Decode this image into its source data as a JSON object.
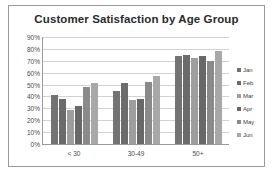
{
  "chart_data": {
    "type": "bar",
    "title": "Customer Satisfaction by Age Group",
    "xlabel": "",
    "ylabel": "",
    "categories": [
      "< 30",
      "30-49",
      "50+"
    ],
    "series": [
      {
        "name": "Jan",
        "values": [
          41,
          45,
          74
        ],
        "color": "#737373"
      },
      {
        "name": "Feb",
        "values": [
          38,
          51,
          75
        ],
        "color": "#6b6b6b"
      },
      {
        "name": "Mar",
        "values": [
          29,
          37,
          72
        ],
        "color": "#9e9e9e"
      },
      {
        "name": "Apr",
        "values": [
          32,
          38,
          74
        ],
        "color": "#686868"
      },
      {
        "name": "May",
        "values": [
          48,
          52,
          70
        ],
        "color": "#8a8a8a"
      },
      {
        "name": "Jun",
        "values": [
          51,
          57,
          78
        ],
        "color": "#a8a8a8"
      }
    ],
    "ylim": [
      0,
      90
    ],
    "y_ticks": [
      "90%",
      "80%",
      "70%",
      "60%",
      "50%",
      "40%",
      "30%",
      "20%",
      "10%",
      "0%"
    ],
    "y_tick_values": [
      90,
      80,
      70,
      60,
      50,
      40,
      30,
      20,
      10,
      0
    ],
    "grid": true,
    "legend_position": "right",
    "value_suffix": "%"
  },
  "frame": {
    "border_color": "#9a9a9a",
    "background": "#ffffff"
  }
}
